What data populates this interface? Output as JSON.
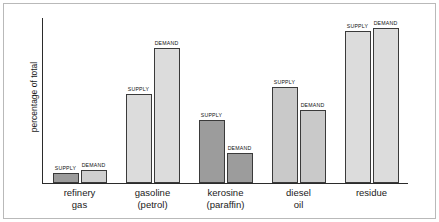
{
  "chart_data": {
    "type": "bar",
    "title": "",
    "xlabel": "",
    "ylabel": "percentage of total",
    "ylim": [
      0,
      50
    ],
    "grid": false,
    "legend_position": "none",
    "categories": [
      "refinery gas",
      "gasoline (petrol)",
      "kerosine (paraffin)",
      "diesel oil",
      "residue"
    ],
    "category_lines": [
      [
        "refinery",
        "gas"
      ],
      [
        "gasoline",
        "(petrol)"
      ],
      [
        "kerosine",
        "(paraffin)"
      ],
      [
        "diesel",
        "oil"
      ],
      [
        "residue",
        ""
      ]
    ],
    "series": [
      {
        "name": "SUPPLY",
        "values": [
          3,
          27,
          19,
          29,
          46
        ]
      },
      {
        "name": "DEMAND",
        "values": [
          4,
          41,
          9,
          22,
          47
        ]
      }
    ],
    "bar_colors": {
      "light": "#dcdcdc",
      "dark": "#9c9c9c",
      "outline": "#3a3a3a"
    },
    "bar_fill_by_group": [
      {
        "supply": "#9c9c9c",
        "demand": "#cfcfcf"
      },
      {
        "supply": "#dcdcdc",
        "demand": "#dcdcdc"
      },
      {
        "supply": "#9c9c9c",
        "demand": "#9c9c9c"
      },
      {
        "supply": "#c9c9c9",
        "demand": "#c9c9c9"
      },
      {
        "supply": "#dcdcdc",
        "demand": "#dcdcdc"
      }
    ],
    "bar_labels": {
      "supply": "SUPPLY",
      "demand": "DEMAND"
    }
  }
}
